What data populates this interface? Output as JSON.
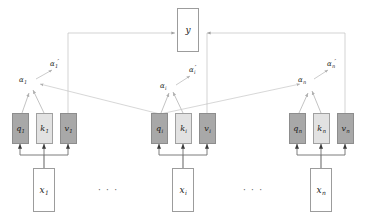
{
  "figure": {
    "colors": {
      "q_fill": "#a8a8a8",
      "k_fill": "#e2e2e2",
      "v_fill": "#a8a8a8",
      "x_fill": "#ffffff",
      "y_fill": "#ffffff",
      "stroke": "#9a9a9a",
      "wire": "#b4b4b4",
      "arrow_dark": "#3a3a3a"
    }
  },
  "output": {
    "label": "y"
  },
  "ellipses": {
    "left": "· · ·",
    "right": "· · ·"
  },
  "groups": [
    {
      "id": "group-1",
      "index": "1",
      "input": {
        "label": "x",
        "sub": "1"
      },
      "q": {
        "label": "q",
        "sub": "1"
      },
      "k": {
        "label": "k",
        "sub": "1"
      },
      "v": {
        "label": "v",
        "sub": "1"
      },
      "alpha": {
        "label": "α",
        "sub": "1",
        "prime": ""
      },
      "alpha_prime": {
        "label": "α",
        "sub": "1",
        "prime": "′"
      }
    },
    {
      "id": "group-2",
      "index": "i",
      "input": {
        "label": "x",
        "sub": "i"
      },
      "q": {
        "label": "q",
        "sub": "i"
      },
      "k": {
        "label": "k",
        "sub": "i"
      },
      "v": {
        "label": "v",
        "sub": "i"
      },
      "alpha": {
        "label": "α",
        "sub": "i",
        "prime": ""
      },
      "alpha_prime": {
        "label": "α",
        "sub": "i",
        "prime": "′"
      }
    },
    {
      "id": "group-3",
      "index": "n",
      "input": {
        "label": "x",
        "sub": "n"
      },
      "q": {
        "label": "q",
        "sub": "n"
      },
      "k": {
        "label": "k",
        "sub": "n"
      },
      "v": {
        "label": "v",
        "sub": "n"
      },
      "alpha": {
        "label": "α",
        "sub": "n",
        "prime": ""
      },
      "alpha_prime": {
        "label": "α",
        "sub": "n",
        "prime": "′"
      }
    }
  ]
}
